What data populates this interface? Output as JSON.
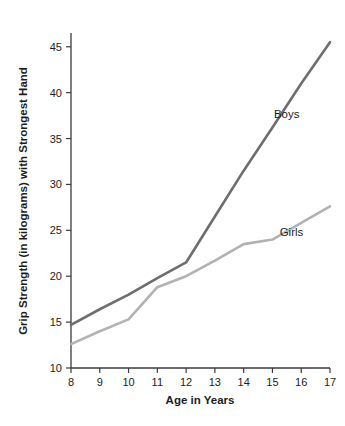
{
  "chart_data": {
    "type": "line",
    "title": "",
    "subtitle": "",
    "xlabel": "Age in Years",
    "ylabel": "Grip Strength (in kilograms) with Strongest Hand",
    "x": [
      8,
      9,
      10,
      11,
      12,
      13,
      14,
      15,
      16,
      17
    ],
    "xticklabels": [
      "8",
      "9",
      "10",
      "11",
      "12",
      "13",
      "14",
      "15",
      "16",
      "17"
    ],
    "yticks": [
      10,
      15,
      20,
      25,
      30,
      35,
      40,
      45
    ],
    "yticklabels": [
      "10",
      "15",
      "20",
      "25",
      "30",
      "35",
      "40",
      "45"
    ],
    "xlim": [
      8,
      17
    ],
    "ylim": [
      10,
      46.5
    ],
    "grid": false,
    "legend_position": "inline-annotation",
    "series": [
      {
        "name": "Boys",
        "color": "#6e6e6e",
        "values": [
          14.7,
          16.4,
          18.0,
          19.8,
          21.5,
          26.5,
          31.5,
          36.2,
          41.0,
          45.5
        ],
        "annotation": {
          "text": "Boys",
          "x": 15.05,
          "y": 37.2
        }
      },
      {
        "name": "Girls",
        "color": "#b2b2b2",
        "values": [
          12.6,
          14.0,
          15.3,
          18.8,
          20.0,
          21.7,
          23.5,
          24.0,
          25.8,
          27.6
        ],
        "annotation": {
          "text": "Girls",
          "x": 15.25,
          "y": 24.4
        }
      }
    ]
  },
  "axis": {
    "x_title": "Age in Years",
    "y_title": "Grip Strength (in kilograms) with Strongest Hand"
  },
  "colors": {
    "boys_line": "#6e6e6e",
    "girls_line": "#b2b2b2",
    "axis": "#3b3b3b",
    "text": "#1c1c1c",
    "background": "#ffffff"
  }
}
